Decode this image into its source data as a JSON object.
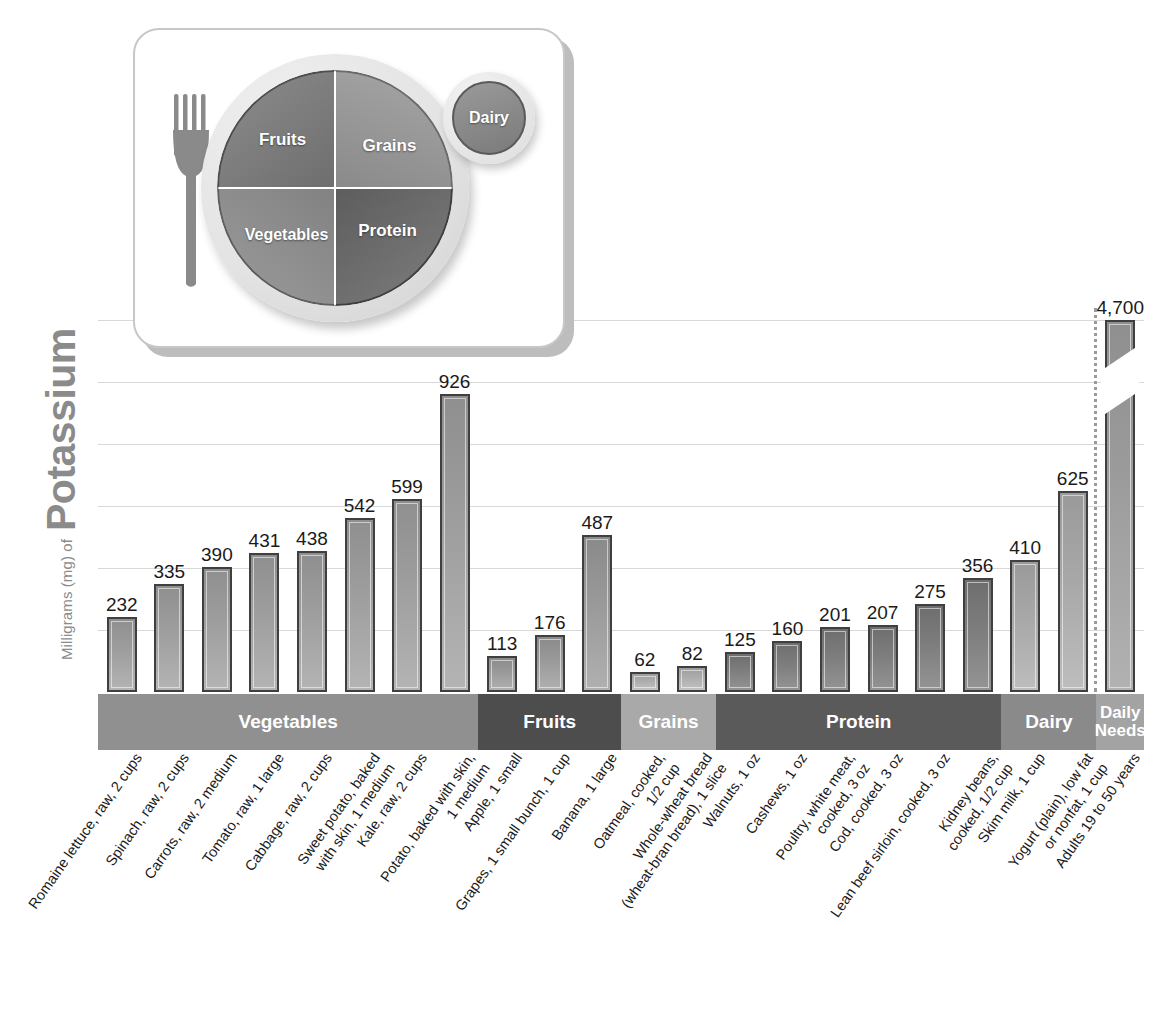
{
  "chart_data": {
    "type": "bar",
    "title": "Potassium",
    "ylabel_small": "Milligrams (mg) of",
    "ylabel_big": "Potassium",
    "xlabel": "",
    "ylim": [
      0,
      1000
    ],
    "grid": true,
    "gridlines_mg": [
      193,
      386,
      579,
      772,
      965,
      1158
    ],
    "legend_position": "none",
    "categories": [
      "Romaine lettuce, raw, 2 cups",
      "Spinach, raw, 2 cups",
      "Carrots, raw, 2 medium",
      "Tomato, raw, 1 large",
      "Cabbage, raw, 2 cups",
      "Sweet potato, baked\nwith skin, 1 medium",
      "Kale, raw, 2 cups",
      "Potato, baked with skin,\n1 medium",
      "Apple, 1 small",
      "Grapes, 1 small bunch, 1 cup",
      "Banana, 1 large",
      "Oatmeal, cooked,\n1/2 cup",
      "Whole-wheat bread\n(wheat-bran bread), 1 slice",
      "Walnuts, 1 oz",
      "Cashews, 1 oz",
      "Poultry, white meat,\ncooked, 3 oz",
      "Cod, cooked, 3 oz",
      "Lean beef sirloin, cooked, 3 oz",
      "Kidney beans,\ncooked, 1/2 cup",
      "Skim milk, 1 cup",
      "Yogurt (plain), low fat\nor nonfat, 1 cup",
      "Adults 19 to 50 years"
    ],
    "values": [
      232,
      335,
      390,
      431,
      438,
      542,
      599,
      926,
      113,
      176,
      487,
      62,
      82,
      125,
      160,
      201,
      207,
      275,
      356,
      410,
      625,
      4700
    ],
    "value_labels": [
      "232",
      "335",
      "390",
      "431",
      "438",
      "542",
      "599",
      "926",
      "113",
      "176",
      "487",
      "62",
      "82",
      "125",
      "160",
      "201",
      "207",
      "275",
      "356",
      "410",
      "625",
      "4,700"
    ],
    "groups": [
      {
        "name": "Vegetables",
        "count": 8,
        "color": "#909090",
        "key": "veg"
      },
      {
        "name": "Fruits",
        "count": 3,
        "color": "#4d4d4d",
        "key": "fruit"
      },
      {
        "name": "Grains",
        "count": 2,
        "color": "#a9a9a9",
        "key": "grain"
      },
      {
        "name": "Protein",
        "count": 6,
        "color": "#5a5a5a",
        "key": "prot"
      },
      {
        "name": "Dairy",
        "count": 2,
        "color": "#8a8a8a",
        "key": "dairy"
      },
      {
        "name": "Daily Needs",
        "count": 1,
        "color": "#a3a3a3",
        "key": "daily"
      }
    ],
    "axis_break": {
      "on_category": "Adults 19 to 50 years",
      "note": "bar truncated with diagonal break"
    },
    "separator": {
      "before_category": "Adults 19 to 50 years",
      "style": "dotted"
    }
  },
  "myplate": {
    "fruits_label": "Fruits",
    "grains_label": "Grains",
    "vegetables_label": "Vegetables",
    "protein_label": "Protein",
    "dairy_label": "Dairy"
  }
}
